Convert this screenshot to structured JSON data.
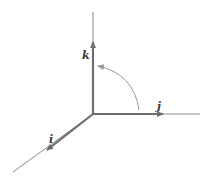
{
  "diagram": {
    "title": "",
    "colors": {
      "axis": "#8a8a8a",
      "vector": "#6e6e6e",
      "arc": "#9a9a9a",
      "label": "#3a3a3a"
    },
    "labels": {
      "k": "k",
      "j": "j",
      "i": "i"
    },
    "vectors": [
      {
        "name": "i",
        "direction": "toward viewer (lower-left)"
      },
      {
        "name": "j",
        "direction": "right"
      },
      {
        "name": "k",
        "direction": "up"
      }
    ],
    "rotation_arrow": {
      "from": "j",
      "to": "k"
    }
  }
}
